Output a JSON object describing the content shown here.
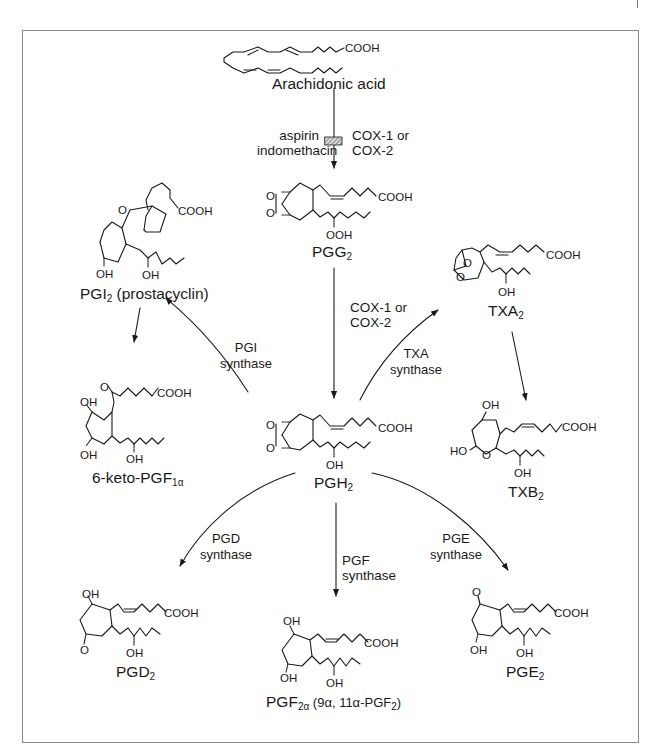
{
  "diagram": {
    "compounds": {
      "arachidonic_acid": {
        "name": "Arachidonic acid",
        "group": "COOH"
      },
      "pgg2": {
        "name": "PGG",
        "sub": "2",
        "groups": [
          "COOH",
          "OOH"
        ]
      },
      "pgh2": {
        "name": "PGH",
        "sub": "2",
        "groups": [
          "COOH",
          "OH"
        ]
      },
      "pgi2": {
        "name": "PGI",
        "sub": "2",
        "suffix": " (prostacyclin)",
        "groups": [
          "COOH",
          "OH",
          "OH",
          "O"
        ]
      },
      "keto_pgf1a": {
        "name": "6-keto-PGF",
        "sub": "1α",
        "groups": [
          "O",
          "COOH",
          "OH",
          "OH",
          "OH"
        ]
      },
      "txa2": {
        "name": "TXA",
        "sub": "2",
        "groups": [
          "COOH",
          "OH",
          "O",
          "O"
        ]
      },
      "txb2": {
        "name": "TXB",
        "sub": "2",
        "groups": [
          "OH",
          "COOH",
          "HO",
          "O",
          "OH"
        ]
      },
      "pgd2": {
        "name": "PGD",
        "sub": "2",
        "groups": [
          "OH",
          "COOH",
          "O",
          "OH"
        ]
      },
      "pgf2a": {
        "name": "PGF",
        "sub": "2α",
        "suffix_a": " (9α, 11α-PGF",
        "suffix_sub": "2",
        "suffix_b": ")",
        "groups": [
          "OH",
          "COOH",
          "OH",
          "OH"
        ]
      },
      "pge2": {
        "name": "PGE",
        "sub": "2",
        "groups": [
          "O",
          "COOH",
          "OH",
          "OH"
        ]
      }
    },
    "enzymes": {
      "cox_top": {
        "line1": "COX-1 or",
        "line2": "COX-2"
      },
      "inhibitors": {
        "line1": "aspirin",
        "line2": "indomethacin"
      },
      "cox_mid": {
        "line1": "COX-1 or",
        "line2": "COX-2"
      },
      "pgi_synthase": {
        "line1": "PGI",
        "line2": "synthase"
      },
      "txa_synthase": {
        "line1": "TXA",
        "line2": "synthase"
      },
      "pgd_synthase": {
        "line1": "PGD",
        "line2": "synthase"
      },
      "pgf_synthase": {
        "line1": "PGF",
        "line2": "synthase"
      },
      "pge_synthase": {
        "line1": "PGE",
        "line2": "synthase"
      }
    },
    "colors": {
      "ink": "#1a1a1a",
      "frame": "#8a8a8a",
      "inhibitor_block": "#9a9a9a"
    }
  }
}
